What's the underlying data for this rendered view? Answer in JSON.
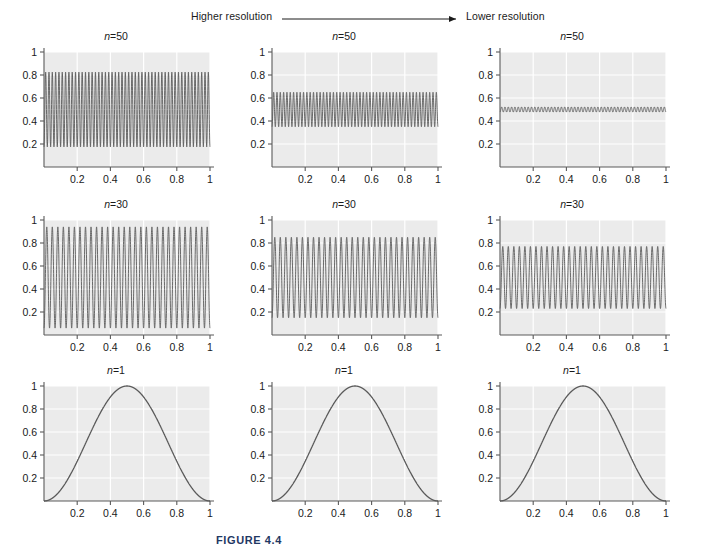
{
  "annotation": {
    "left_label": "Higher resolution",
    "right_label": "Lower resolution",
    "arrow_icon_name": "right-arrow-icon"
  },
  "caption": {
    "text": "FIGURE 4.4"
  },
  "style": {
    "panel_background": "#ebebeb",
    "gridline_color": "#ffffff",
    "curve_color": "#5a5a5a",
    "axis_color": "#5a5a5a",
    "caption_color": "#1f3864"
  },
  "chart_data": [
    {
      "id": "plot-r1c1",
      "type": "line",
      "title": "n=50",
      "n": 50,
      "row": 1,
      "col": 1,
      "column_label": "Higher resolution",
      "envelope_amplitude": 0.325,
      "mean_level": 0.5,
      "ymin_trace": 0.175,
      "ymax_trace": 0.825,
      "xlabel": "",
      "ylabel": "",
      "xlim": [
        0,
        1
      ],
      "ylim": [
        0,
        1
      ],
      "xticks": [
        0.2,
        0.4,
        0.6,
        0.8,
        1
      ],
      "xticklabels": [
        "0.2",
        "0.4",
        "0.6",
        "0.8",
        "1"
      ],
      "yticks": [
        0.2,
        0.4,
        0.6,
        0.8,
        1
      ],
      "yticklabels": [
        "0.2",
        "0.4",
        "0.6",
        "0.8",
        "1"
      ],
      "grid": true
    },
    {
      "id": "plot-r1c2",
      "type": "line",
      "title": "n=50",
      "n": 50,
      "row": 1,
      "col": 2,
      "column_label": "Medium resolution",
      "envelope_amplitude": 0.15,
      "mean_level": 0.5,
      "ymin_trace": 0.35,
      "ymax_trace": 0.65,
      "xlabel": "",
      "ylabel": "",
      "xlim": [
        0,
        1
      ],
      "ylim": [
        0,
        1
      ],
      "xticks": [
        0.2,
        0.4,
        0.6,
        0.8,
        1
      ],
      "xticklabels": [
        "0.2",
        "0.4",
        "0.6",
        "0.8",
        "1"
      ],
      "yticks": [
        0.2,
        0.4,
        0.6,
        0.8,
        1
      ],
      "yticklabels": [
        "0.2",
        "0.4",
        "0.6",
        "0.8",
        "1"
      ],
      "grid": true
    },
    {
      "id": "plot-r1c3",
      "type": "line",
      "title": "n=50",
      "n": 50,
      "row": 1,
      "col": 3,
      "column_label": "Lower resolution",
      "envelope_amplitude": 0.022,
      "mean_level": 0.5,
      "ymin_trace": 0.478,
      "ymax_trace": 0.522,
      "xlabel": "",
      "ylabel": "",
      "xlim": [
        0,
        1
      ],
      "ylim": [
        0,
        1
      ],
      "xticks": [
        0.2,
        0.4,
        0.6,
        0.8,
        1
      ],
      "xticklabels": [
        "0.2",
        "0.4",
        "0.6",
        "0.8",
        "1"
      ],
      "yticks": [
        0.2,
        0.4,
        0.6,
        0.8,
        1
      ],
      "yticklabels": [
        "0.2",
        "0.4",
        "0.6",
        "0.8",
        "1"
      ],
      "grid": true
    },
    {
      "id": "plot-r2c1",
      "type": "line",
      "title": "n=30",
      "n": 30,
      "row": 2,
      "col": 1,
      "column_label": "Higher resolution",
      "envelope_amplitude": 0.44,
      "mean_level": 0.5,
      "ymin_trace": 0.06,
      "ymax_trace": 0.94,
      "xlabel": "",
      "ylabel": "",
      "xlim": [
        0,
        1
      ],
      "ylim": [
        0,
        1
      ],
      "xticks": [
        0.2,
        0.4,
        0.6,
        0.8,
        1
      ],
      "xticklabels": [
        "0.2",
        "0.4",
        "0.6",
        "0.8",
        "1"
      ],
      "yticks": [
        0.2,
        0.4,
        0.6,
        0.8,
        1
      ],
      "yticklabels": [
        "0.2",
        "0.4",
        "0.6",
        "0.8",
        "1"
      ],
      "grid": true
    },
    {
      "id": "plot-r2c2",
      "type": "line",
      "title": "n=30",
      "n": 30,
      "row": 2,
      "col": 2,
      "column_label": "Medium resolution",
      "envelope_amplitude": 0.35,
      "mean_level": 0.5,
      "ymin_trace": 0.15,
      "ymax_trace": 0.85,
      "xlabel": "",
      "ylabel": "",
      "xlim": [
        0,
        1
      ],
      "ylim": [
        0,
        1
      ],
      "xticks": [
        0.2,
        0.4,
        0.6,
        0.8,
        1
      ],
      "xticklabels": [
        "0.2",
        "0.4",
        "0.6",
        "0.8",
        "1"
      ],
      "yticks": [
        0.2,
        0.4,
        0.6,
        0.8,
        1
      ],
      "yticklabels": [
        "0.2",
        "0.4",
        "0.6",
        "0.8",
        "1"
      ],
      "grid": true
    },
    {
      "id": "plot-r2c3",
      "type": "line",
      "title": "n=30",
      "n": 30,
      "row": 2,
      "col": 3,
      "column_label": "Lower resolution",
      "envelope_amplitude": 0.27,
      "mean_level": 0.5,
      "ymin_trace": 0.23,
      "ymax_trace": 0.77,
      "xlabel": "",
      "ylabel": "",
      "xlim": [
        0,
        1
      ],
      "ylim": [
        0,
        1
      ],
      "xticks": [
        0.2,
        0.4,
        0.6,
        0.8,
        1
      ],
      "xticklabels": [
        "0.2",
        "0.4",
        "0.6",
        "0.8",
        "1"
      ],
      "yticks": [
        0.2,
        0.4,
        0.6,
        0.8,
        1
      ],
      "yticklabels": [
        "0.2",
        "0.4",
        "0.6",
        "0.8",
        "1"
      ],
      "grid": true
    },
    {
      "id": "plot-r3c1",
      "type": "line",
      "title": "n=1",
      "n": 1,
      "row": 3,
      "col": 1,
      "column_label": "Higher resolution",
      "envelope_amplitude": 0.5,
      "mean_level": 0.5,
      "ymin_trace": 0.0,
      "ymax_trace": 1.0,
      "peak_x": 0.5,
      "peak_y": 1.0,
      "xlabel": "",
      "ylabel": "",
      "xlim": [
        0,
        1
      ],
      "ylim": [
        0,
        1
      ],
      "xticks": [
        0.2,
        0.4,
        0.6,
        0.8,
        1
      ],
      "xticklabels": [
        "0.2",
        "0.4",
        "0.6",
        "0.8",
        "1"
      ],
      "yticks": [
        0.2,
        0.4,
        0.6,
        0.8,
        1
      ],
      "yticklabels": [
        "0.2",
        "0.4",
        "0.6",
        "0.8",
        "1"
      ],
      "grid": true
    },
    {
      "id": "plot-r3c2",
      "type": "line",
      "title": "n=1",
      "n": 1,
      "row": 3,
      "col": 2,
      "column_label": "Medium resolution",
      "envelope_amplitude": 0.5,
      "mean_level": 0.5,
      "ymin_trace": 0.0,
      "ymax_trace": 1.0,
      "peak_x": 0.5,
      "peak_y": 1.0,
      "xlabel": "",
      "ylabel": "",
      "xlim": [
        0,
        1
      ],
      "ylim": [
        0,
        1
      ],
      "xticks": [
        0.2,
        0.4,
        0.6,
        0.8,
        1
      ],
      "xticklabels": [
        "0.2",
        "0.4",
        "0.6",
        "0.8",
        "1"
      ],
      "yticks": [
        0.2,
        0.4,
        0.6,
        0.8,
        1
      ],
      "yticklabels": [
        "0.2",
        "0.4",
        "0.6",
        "0.8",
        "1"
      ],
      "grid": true
    },
    {
      "id": "plot-r3c3",
      "type": "line",
      "title": "n=1",
      "n": 1,
      "row": 3,
      "col": 3,
      "column_label": "Lower resolution",
      "envelope_amplitude": 0.5,
      "mean_level": 0.5,
      "ymin_trace": 0.0,
      "ymax_trace": 1.0,
      "peak_x": 0.5,
      "peak_y": 1.0,
      "xlabel": "",
      "ylabel": "",
      "xlim": [
        0,
        1
      ],
      "ylim": [
        0,
        1
      ],
      "xticks": [
        0.2,
        0.4,
        0.6,
        0.8,
        1
      ],
      "xticklabels": [
        "0.2",
        "0.4",
        "0.6",
        "0.8",
        "1"
      ],
      "yticks": [
        0.2,
        0.4,
        0.6,
        0.8,
        1
      ],
      "yticklabels": [
        "0.2",
        "0.4",
        "0.6",
        "0.8",
        "1"
      ],
      "grid": true
    }
  ]
}
